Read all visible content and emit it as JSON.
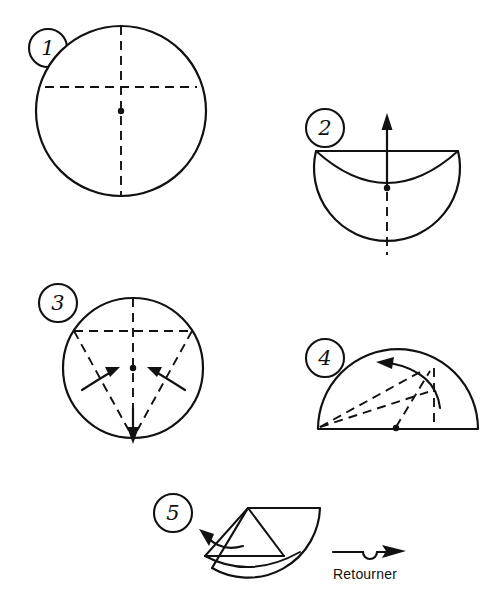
{
  "document": {
    "title": "Origami folding instructions",
    "language": "fr",
    "background_color": "#ffffff",
    "ink_color": "#111111",
    "width": 496,
    "height": 606
  },
  "steps": [
    {
      "number": "1",
      "badge_label": "1",
      "badge": {
        "cx": 48,
        "cy": 48,
        "r": 19
      },
      "shape": "circle",
      "description": "Full circle with dashed vertical diameter and dashed horizontal chord above the center; center dot marked.",
      "geometry": {
        "cx": 121,
        "cy": 111,
        "r": 85,
        "chord_y": 87
      }
    },
    {
      "number": "2",
      "badge_label": "2",
      "badge": {
        "cx": 325,
        "cy": 128,
        "r": 19
      },
      "shape": "circle-folded-top",
      "description": "Circle with the top section folded down: straight top edge, inner arc dipping to center dot, dashed vertical line below, arrow pointing up.",
      "geometry": {
        "cx": 387,
        "cy": 188,
        "r": 73,
        "top_y": 151
      }
    },
    {
      "number": "3",
      "badge_label": "3",
      "badge": {
        "cx": 58,
        "cy": 303,
        "r": 19
      },
      "shape": "circle-with-diagonals",
      "description": "Circle with dashed vertical diameter, dashed horizontal chord and two dashed diagonals converging at the bottom; two curved arrows fold the sides inward and a straight arrow points down.",
      "geometry": {
        "cx": 133,
        "cy": 368,
        "r": 70,
        "chord_y": 331
      }
    },
    {
      "number": "4",
      "badge_label": "4",
      "badge": {
        "cx": 325,
        "cy": 358,
        "r": 19
      },
      "shape": "half-disc",
      "description": "Half disc resting on its flat edge with dashed crease lines radiating from the bottom-left corner and from the centre dot; curved arrow indicates folding to the left.",
      "geometry": {
        "cx": 398,
        "cy": 429,
        "r": 80,
        "base_y": 429
      }
    },
    {
      "number": "5",
      "badge_label": "5",
      "badge": {
        "cx": 173,
        "cy": 513,
        "r": 19
      },
      "shape": "quarter-cone",
      "description": "Cone-shaped result with a flap; curved arrow to the left shows the flap being folded back.",
      "geometry": {
        "apex_x": 248,
        "apex_y": 508
      }
    }
  ],
  "symbols": [
    {
      "name": "turn-over-symbol",
      "caption": "Retourner",
      "icon": "turn-over-arrow",
      "description": "Horizontal arrow with a small loop in the middle pointing right, meaning turn the model over.",
      "position": {
        "x": 333,
        "y": 552
      }
    }
  ],
  "caption": {
    "retourner": "Retourner"
  }
}
